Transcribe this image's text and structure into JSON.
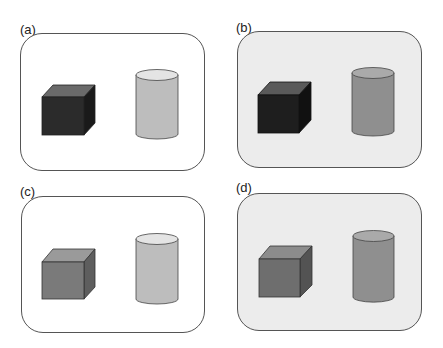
{
  "panels": [
    {
      "id": "a",
      "label": "(a)",
      "background": "#ffffff",
      "cube_front": "#2b2b2b",
      "cube_top": "#6a6a6a",
      "cube_side": "#1a1a1a",
      "cylinder_body": "#bdbdbd",
      "cylinder_top": "#e4e4e4"
    },
    {
      "id": "b",
      "label": "(b)",
      "background": "#ececec",
      "cube_front": "#1e1e1e",
      "cube_top": "#5a5a5a",
      "cube_side": "#111111",
      "cylinder_body": "#8f8f8f",
      "cylinder_top": "#aaaaaa"
    },
    {
      "id": "c",
      "label": "(c)",
      "background": "#ffffff",
      "cube_front": "#7a7a7a",
      "cube_top": "#9a9a9a",
      "cube_side": "#5e5e5e",
      "cylinder_body": "#bdbdbd",
      "cylinder_top": "#e4e4e4"
    },
    {
      "id": "d",
      "label": "(d)",
      "background": "#ececec",
      "cube_front": "#6e6e6e",
      "cube_top": "#8c8c8c",
      "cube_side": "#535353",
      "cylinder_body": "#8f8f8f",
      "cylinder_top": "#aaaaaa"
    }
  ]
}
